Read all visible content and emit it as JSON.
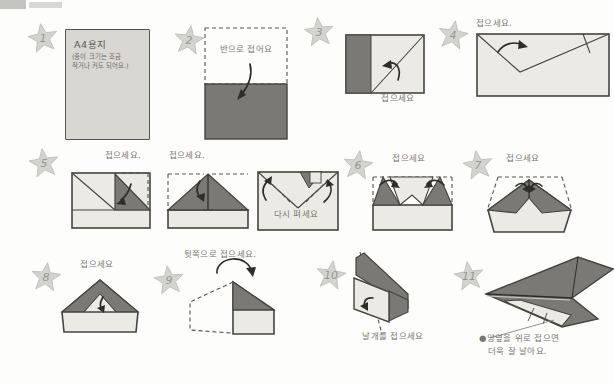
{
  "colors": {
    "dark_fill": "#7a7976",
    "light_fill": "#eceae4",
    "gray_paper": "#d8d7d2",
    "star_fill": "#d3d3d0",
    "outline": "#45443f",
    "label_text": "#7a7771"
  },
  "steps": [
    {
      "number": "1",
      "paper_title": "A4용지",
      "paper_note_line1": "(종이 크기는 조금",
      "paper_note_line2": "작거나 커도 되어요.)"
    },
    {
      "number": "2",
      "label": "반으로 접어요"
    },
    {
      "number": "3",
      "label": "접으세요"
    },
    {
      "number": "4",
      "label": "접으세요."
    },
    {
      "number": "5",
      "label_first": "접으세요.",
      "label_second": "접으세요.",
      "label_third": "다시 펴세요"
    },
    {
      "number": "6",
      "label": "접으세요"
    },
    {
      "number": "7",
      "label": "접으세요"
    },
    {
      "number": "8",
      "label": "접으세요"
    },
    {
      "number": "9",
      "label": "뒷쪽으로 접으세요."
    },
    {
      "number": "10",
      "label": "날개를 접으세요"
    },
    {
      "number": "11",
      "note_line1": "●양옆을 위로 접으면",
      "note_line2": "더욱 잘 날아요."
    }
  ]
}
